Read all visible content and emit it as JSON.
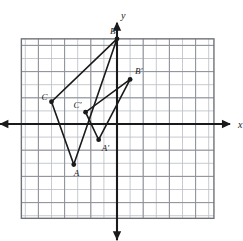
{
  "figure": {
    "axis_labels": {
      "x": "x",
      "y": "y"
    },
    "colors": {
      "grid_minor": "#b9bcc4",
      "grid_major": "#8e9199",
      "grid_border": "#6f7278",
      "axis": "#1a1a1a",
      "shape_stroke": "#1a1a1a",
      "vertex_fill": "#1a1a1a",
      "background": "#ffffff"
    }
  },
  "chart_data": {
    "type": "scatter",
    "title": "",
    "xlabel": "x",
    "ylabel": "y",
    "grid": true,
    "legend": "none",
    "xlim": [
      -7.3,
      7.4
    ],
    "ylim": [
      -7.2,
      6.5
    ],
    "x_ticks": [
      -7,
      -6,
      -5,
      -4,
      -3,
      -2,
      -1,
      0,
      1,
      2,
      3,
      4,
      5,
      6,
      7
    ],
    "y_ticks": [
      -7,
      -6,
      -5,
      -4,
      -3,
      -2,
      -1,
      0,
      1,
      2,
      3,
      4,
      5,
      6
    ],
    "tick_labels_shown": false,
    "grid_spacing": 1,
    "series": [
      {
        "name": "Triangle ABC",
        "closed": true,
        "points": [
          {
            "label": "A",
            "x": -3.3,
            "y": -3.1,
            "label_dx": 0,
            "label_dy": 11
          },
          {
            "label": "B",
            "x": 0.0,
            "y": 6.5,
            "label_dx": -7,
            "label_dy": -5
          },
          {
            "label": "C",
            "x": -5.0,
            "y": 1.7,
            "label_dx": -10,
            "label_dy": -2
          }
        ]
      },
      {
        "name": "Triangle A'B'C'",
        "closed": true,
        "points": [
          {
            "label": "A'",
            "x": -1.4,
            "y": -1.2,
            "label_dx": 3,
            "label_dy": 11
          },
          {
            "label": "B'",
            "x": 1.0,
            "y": 3.4,
            "label_dx": 5,
            "label_dy": -5
          },
          {
            "label": "C'",
            "x": -2.4,
            "y": 0.9,
            "label_dx": -12,
            "label_dy": -4
          }
        ]
      }
    ]
  }
}
